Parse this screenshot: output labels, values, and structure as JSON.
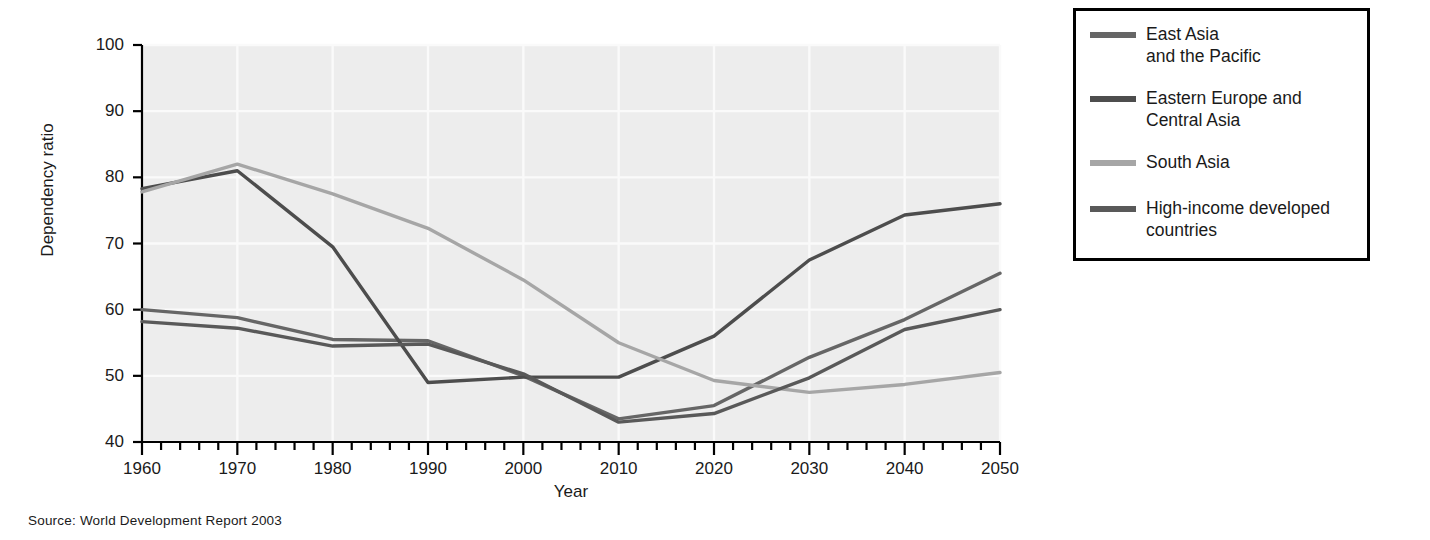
{
  "figure": {
    "source_note": "Source:  World Development Report 2003"
  },
  "axes": {
    "y_title": "Dependency ratio",
    "x_title": "Year",
    "y_ticks": [
      "100",
      "90",
      "80",
      "70",
      "60",
      "50",
      "40"
    ],
    "x_ticks": [
      "1960",
      "1970",
      "1980",
      "1990",
      "2000",
      "2010",
      "2020",
      "2030",
      "2040",
      "2050"
    ]
  },
  "legend": {
    "items": [
      {
        "label": "East Asia\nand the Pacific",
        "color": "#666666"
      },
      {
        "label": "Eastern Europe and\nCentral Asia",
        "color": "#4d4d4d"
      },
      {
        "label": "South Asia",
        "color": "#a6a6a6"
      },
      {
        "label": "High-income developed\ncountries",
        "color": "#595959"
      }
    ]
  },
  "chart_data": {
    "type": "line",
    "title": "",
    "xlabel": "Year",
    "ylabel": "Dependency ratio",
    "xlim": [
      1960,
      2050
    ],
    "ylim": [
      40,
      100
    ],
    "grid": true,
    "legend_position": "right-outside",
    "x": [
      1960,
      1970,
      1980,
      1990,
      2000,
      2010,
      2020,
      2030,
      2040,
      2050
    ],
    "series": [
      {
        "name": "East Asia and the Pacific",
        "color": "#666666",
        "values": [
          60.0,
          58.8,
          55.5,
          55.3,
          50.0,
          43.5,
          45.5,
          52.8,
          58.5,
          65.5
        ]
      },
      {
        "name": "Eastern Europe and Central Asia",
        "color": "#4d4d4d",
        "values": [
          78.3,
          81.0,
          69.5,
          49.0,
          49.8,
          49.8,
          56.0,
          67.5,
          74.3,
          76.0
        ]
      },
      {
        "name": "South Asia",
        "color": "#a6a6a6",
        "values": [
          77.8,
          82.0,
          77.5,
          72.3,
          64.5,
          55.0,
          49.3,
          47.5,
          48.7,
          50.5
        ]
      },
      {
        "name": "High-income developed countries",
        "color": "#595959",
        "values": [
          58.2,
          57.2,
          54.5,
          54.8,
          50.3,
          43.0,
          44.3,
          49.7,
          57.0,
          60.0
        ]
      }
    ]
  },
  "plot_style": {
    "background": "#ededed",
    "gridline": "#fafafa",
    "axis_color": "#000000"
  }
}
